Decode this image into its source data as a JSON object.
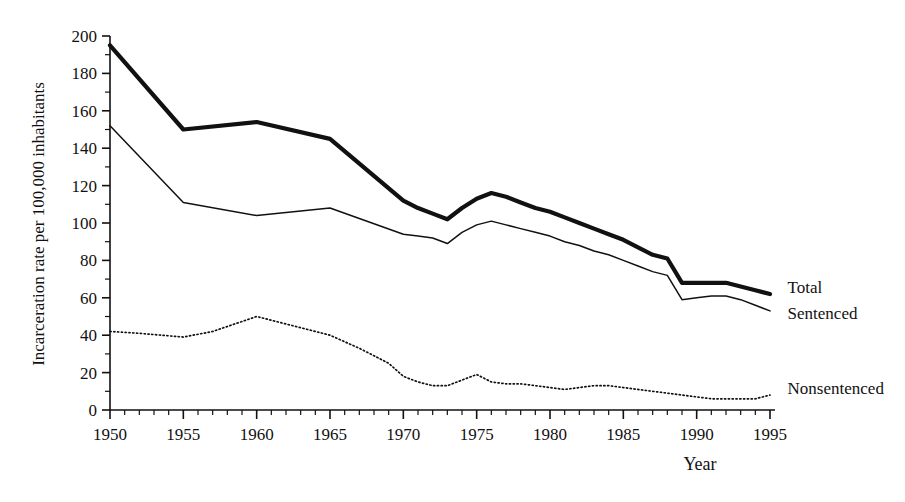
{
  "chart_data": {
    "type": "line",
    "title": "",
    "xlabel": "Year",
    "ylabel": "Incarceration rate per 100,000 inhabitants",
    "xlim": [
      1950,
      1995
    ],
    "ylim": [
      0,
      200
    ],
    "grid": false,
    "legend_position": "right-inline-labels",
    "x_major_ticks": [
      1950,
      1955,
      1960,
      1965,
      1970,
      1975,
      1980,
      1985,
      1990,
      1995
    ],
    "x_tick_labels": [
      "1950",
      "1955",
      "1960",
      "1965",
      "1970",
      "1975",
      "1980",
      "1985",
      "1990",
      "1995"
    ],
    "x_minor_tick_step": 1,
    "y_major_ticks": [
      0,
      20,
      40,
      60,
      80,
      100,
      120,
      140,
      160,
      180,
      200
    ],
    "y_tick_labels": [
      "0",
      "20",
      "40",
      "60",
      "80",
      "100",
      "120",
      "140",
      "160",
      "180",
      "200"
    ],
    "y_minor_tick_step": 10,
    "series": [
      {
        "name": "Total",
        "style": "thick-solid",
        "label": "Total",
        "label_x": 1996.2,
        "label_y": 66,
        "x": [
          1950,
          1955,
          1960,
          1965,
          1970,
          1971,
          1972,
          1973,
          1974,
          1975,
          1976,
          1977,
          1978,
          1979,
          1980,
          1981,
          1982,
          1983,
          1984,
          1985,
          1986,
          1987,
          1988,
          1989,
          1990,
          1991,
          1992,
          1993,
          1994,
          1995
        ],
        "values": [
          195,
          150,
          154,
          145,
          112,
          108,
          105,
          102,
          108,
          113,
          116,
          114,
          111,
          108,
          106,
          103,
          100,
          97,
          94,
          91,
          87,
          83,
          81,
          68,
          68,
          68,
          68,
          66,
          64,
          62
        ]
      },
      {
        "name": "Sentenced",
        "style": "thin-solid",
        "label": "Sentenced",
        "label_x": 1996.2,
        "label_y": 52,
        "x": [
          1950,
          1955,
          1960,
          1965,
          1970,
          1971,
          1972,
          1973,
          1974,
          1975,
          1976,
          1977,
          1978,
          1979,
          1980,
          1981,
          1982,
          1983,
          1984,
          1985,
          1986,
          1987,
          1988,
          1989,
          1990,
          1991,
          1992,
          1993,
          1994,
          1995
        ],
        "values": [
          152,
          111,
          104,
          108,
          94,
          93,
          92,
          89,
          95,
          99,
          101,
          99,
          97,
          95,
          93,
          90,
          88,
          85,
          83,
          80,
          77,
          74,
          72,
          59,
          60,
          61,
          61,
          59,
          56,
          53
        ]
      },
      {
        "name": "Nonsentenced",
        "style": "dotted",
        "label": "Nonsentenced",
        "label_x": 1996.2,
        "label_y": 12,
        "x": [
          1950,
          1952,
          1955,
          1957,
          1960,
          1962,
          1965,
          1967,
          1969,
          1970,
          1971,
          1972,
          1973,
          1974,
          1975,
          1976,
          1977,
          1978,
          1979,
          1980,
          1981,
          1982,
          1983,
          1984,
          1985,
          1986,
          1987,
          1988,
          1989,
          1990,
          1991,
          1992,
          1993,
          1994,
          1995
        ],
        "values": [
          42,
          41,
          39,
          42,
          50,
          46,
          40,
          33,
          25,
          18,
          15,
          13,
          13,
          16,
          19,
          15,
          14,
          14,
          13,
          12,
          11,
          12,
          13,
          13,
          12,
          11,
          10,
          9,
          8,
          7,
          6,
          6,
          6,
          6,
          8
        ]
      }
    ]
  },
  "axes": {
    "y_axis_title": "Incarceration rate per 100,000 inhabitants",
    "x_axis_title": "Year"
  }
}
